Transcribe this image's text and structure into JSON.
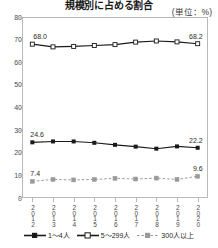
{
  "chart_title": "規模別に占める割合",
  "unit_note": "(単位：%)",
  "axis": {
    "y_ticks": [
      "80",
      "70",
      "60",
      "50",
      "40",
      "30",
      "20",
      "10",
      "0"
    ],
    "x_ticks": [
      "2012",
      "2013",
      "2014",
      "2015",
      "2016",
      "2017",
      "2018",
      "2019",
      "2020"
    ]
  },
  "legend": {
    "items": [
      {
        "label": "1〜4人",
        "marker": "filled-square-icon",
        "color": "#1a1a1a",
        "dash": "solid"
      },
      {
        "label": "5〜299人",
        "marker": "open-square-icon",
        "color": "#1a1a1a",
        "dash": "solid"
      },
      {
        "label": "300人以上",
        "marker": "gray-square-icon",
        "color": "#9a9a9a",
        "dash": "dashed"
      }
    ]
  },
  "labels": {
    "mid_start": "68.0",
    "mid_end": "68.2",
    "small_start": "24.6",
    "small_end": "22.2",
    "large_start": "7.4",
    "large_end": "9.6"
  },
  "chart_data": {
    "type": "line",
    "title": "規模別に占める割合",
    "xlabel": "",
    "ylabel": "",
    "unit": "%",
    "ylim": [
      0,
      80
    ],
    "ytick_step": 10,
    "grid": false,
    "legend_position": "bottom",
    "categories": [
      "2012",
      "2013",
      "2014",
      "2015",
      "2016",
      "2017",
      "2018",
      "2019",
      "2020"
    ],
    "series": [
      {
        "name": "1〜4人",
        "color": "#1a1a1a",
        "marker": "filled-square",
        "dash": "solid",
        "values": [
          24.6,
          25.0,
          25.0,
          24.4,
          23.5,
          22.7,
          21.8,
          22.8,
          22.2
        ],
        "labeled_points": {
          "2012": "24.6",
          "2020": "22.2"
        }
      },
      {
        "name": "5〜299人",
        "color": "#1a1a1a",
        "marker": "open-square",
        "dash": "solid",
        "values": [
          68.0,
          66.8,
          67.0,
          67.4,
          67.8,
          68.9,
          69.4,
          69.0,
          68.2
        ],
        "labeled_points": {
          "2012": "68.0",
          "2020": "68.2"
        }
      },
      {
        "name": "300人以上",
        "color": "#9a9a9a",
        "marker": "gray-square",
        "dash": "dashed",
        "values": [
          7.4,
          8.2,
          8.0,
          8.2,
          8.7,
          8.4,
          8.8,
          8.2,
          9.6
        ],
        "labeled_points": {
          "2012": "7.4",
          "2020": "9.6"
        }
      }
    ]
  }
}
